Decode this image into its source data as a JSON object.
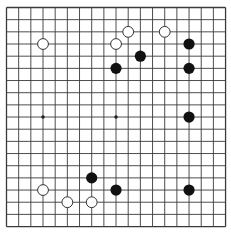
{
  "board": {
    "size": 19,
    "origin_x": 6.5,
    "origin_y": 7.5,
    "spacing": 12.17,
    "line_color": "#3a3a3a",
    "border_color": "#555555",
    "star_points": [
      [
        3,
        9
      ],
      [
        9,
        9
      ]
    ],
    "stones": [
      {
        "color": "white",
        "col": 3,
        "row": 3
      },
      {
        "color": "white",
        "col": 10,
        "row": 2
      },
      {
        "color": "white",
        "col": 9,
        "row": 3
      },
      {
        "color": "white",
        "col": 13,
        "row": 2
      },
      {
        "color": "black",
        "col": 11,
        "row": 4
      },
      {
        "color": "black",
        "col": 9,
        "row": 5
      },
      {
        "color": "black",
        "col": 15,
        "row": 3
      },
      {
        "color": "black",
        "col": 15,
        "row": 5
      },
      {
        "color": "black",
        "col": 15,
        "row": 9
      },
      {
        "color": "black",
        "col": 7,
        "row": 14
      },
      {
        "color": "black",
        "col": 9,
        "row": 15
      },
      {
        "color": "black",
        "col": 15,
        "row": 15
      },
      {
        "color": "white",
        "col": 3,
        "row": 15
      },
      {
        "color": "white",
        "col": 5,
        "row": 16
      },
      {
        "color": "white",
        "col": 7,
        "row": 16
      }
    ]
  }
}
